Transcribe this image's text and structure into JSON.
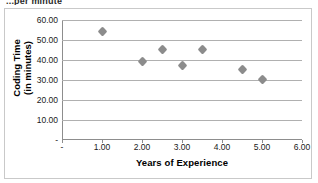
{
  "page": {
    "cut_off_header_text": "...per minute"
  },
  "chart_data": {
    "type": "scatter",
    "title": "",
    "xlabel": "Years of Experience",
    "ylabel_line1": "Coding Time",
    "ylabel_line2": "(in minutes)",
    "ylabel": "Coding Time (in minutes)",
    "xlim": [
      0,
      6
    ],
    "ylim": [
      0,
      60
    ],
    "grid": "horizontal",
    "legend": "none",
    "marker_color": "#8c8c8c",
    "gridline_color": "#b0b0b0",
    "axis_color": "#8d8d8d",
    "xticks": [
      0,
      1,
      2,
      3,
      4,
      5,
      6
    ],
    "xticklabels": [
      "-",
      "1.00",
      "2.00",
      "3.00",
      "4.00",
      "5.00",
      "6.00"
    ],
    "yticks": [
      0,
      10,
      20,
      30,
      40,
      50,
      60
    ],
    "yticklabels": [
      "-",
      "10.00",
      "20.00",
      "30.00",
      "40.00",
      "50.00",
      "60.00"
    ],
    "points": [
      {
        "x": 1.0,
        "y": 54.5
      },
      {
        "x": 2.0,
        "y": 39.5
      },
      {
        "x": 2.5,
        "y": 45.2
      },
      {
        "x": 3.0,
        "y": 37.5
      },
      {
        "x": 3.5,
        "y": 45.3
      },
      {
        "x": 4.5,
        "y": 35.5
      },
      {
        "x": 5.0,
        "y": 30.5
      }
    ]
  }
}
